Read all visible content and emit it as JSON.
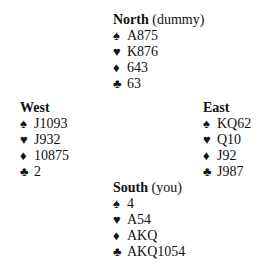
{
  "suits": {
    "spades": "♠",
    "hearts": "♥",
    "diamonds": "♦",
    "clubs": "♣"
  },
  "hands": {
    "north": {
      "name": "North",
      "role": "(dummy)",
      "spades": "A875",
      "hearts": "K876",
      "diamonds": "643",
      "clubs": "63"
    },
    "west": {
      "name": "West",
      "role": "",
      "spades": "J1093",
      "hearts": "J932",
      "diamonds": "10875",
      "clubs": "2"
    },
    "east": {
      "name": "East",
      "role": "",
      "spades": "KQ62",
      "hearts": "Q10",
      "diamonds": "J92",
      "clubs": "J987"
    },
    "south": {
      "name": "South",
      "role": "(you)",
      "spades": "4",
      "hearts": "A54",
      "diamonds": "AKQ",
      "clubs": "AKQ1054"
    }
  }
}
